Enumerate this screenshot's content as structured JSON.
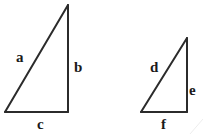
{
  "figure": {
    "background_color": "#ffffff",
    "stroke_color": "#2b2b2b",
    "label_color": "#1a1a1a",
    "stroke_width": 2,
    "triangles": [
      {
        "name": "large-triangle",
        "right_angle_at": "bottom-right",
        "vertices": {
          "apex": [
            68,
            5
          ],
          "bottom_right": [
            68,
            112
          ],
          "bottom_left": [
            5,
            112
          ]
        },
        "sides": {
          "hypotenuse_label": "a",
          "vertical_label": "b",
          "base_label": "c"
        }
      },
      {
        "name": "small-triangle",
        "right_angle_at": "bottom-right",
        "vertices": {
          "apex": [
            187,
            38
          ],
          "bottom_right": [
            187,
            112
          ],
          "bottom_left": [
            141,
            112
          ]
        },
        "sides": {
          "hypotenuse_label": "d",
          "vertical_label": "e",
          "base_label": "f"
        }
      }
    ],
    "labels": {
      "a": "a",
      "b": "b",
      "c": "c",
      "d": "d",
      "e": "e",
      "f": "f"
    }
  }
}
